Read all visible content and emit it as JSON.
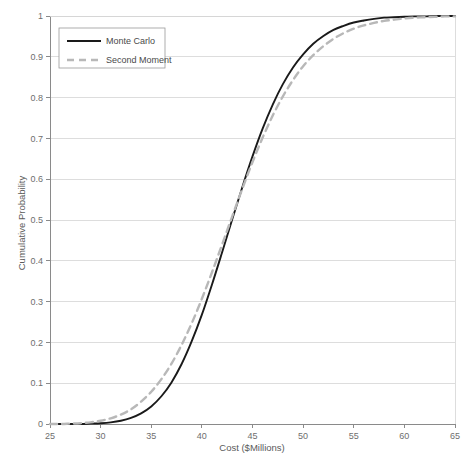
{
  "chart_data": {
    "type": "line",
    "title": "",
    "subtitle": "",
    "xlabel": "Cost ($Millions)",
    "ylabel": "Cumulative Probability",
    "xlim": [
      25,
      65
    ],
    "ylim": [
      0,
      1
    ],
    "xticks": [
      25,
      30,
      35,
      40,
      45,
      50,
      55,
      60,
      65
    ],
    "xtick_labels": [
      "25",
      "30",
      "35",
      "40",
      "45",
      "50",
      "55",
      "60",
      "65"
    ],
    "yticks": [
      0,
      0.1,
      0.2,
      0.3,
      0.4,
      0.5,
      0.6,
      0.7,
      0.8,
      0.9,
      1
    ],
    "ytick_labels": [
      "0",
      "0.1",
      "0.2",
      "0.3",
      "0.4",
      "0.5",
      "0.6",
      "0.7",
      "0.8",
      "0.9",
      "1"
    ],
    "grid": "horizontal",
    "legend_position": "top-left",
    "x": [
      25,
      26,
      27,
      28,
      29,
      30,
      31,
      32,
      33,
      34,
      35,
      36,
      37,
      38,
      39,
      40,
      41,
      42,
      43,
      44,
      45,
      46,
      47,
      48,
      49,
      50,
      51,
      52,
      53,
      54,
      55,
      56,
      57,
      58,
      59,
      60,
      61,
      62,
      63,
      64,
      65
    ],
    "series": [
      {
        "name": "Monte Carlo",
        "color": "#1a1a1a",
        "style": "solid",
        "width": 1.9,
        "values": [
          0.0,
          0.0,
          0.0,
          0.0,
          0.001,
          0.002,
          0.004,
          0.008,
          0.015,
          0.026,
          0.043,
          0.068,
          0.102,
          0.147,
          0.203,
          0.268,
          0.342,
          0.421,
          0.502,
          0.581,
          0.656,
          0.724,
          0.783,
          0.833,
          0.874,
          0.906,
          0.932,
          0.951,
          0.966,
          0.976,
          0.984,
          0.989,
          0.993,
          0.996,
          0.997,
          0.998,
          0.999,
          0.999,
          1.0,
          1.0,
          1.0
        ]
      },
      {
        "name": "Second Moment",
        "color": "#b8b8b8",
        "style": "dashed",
        "width": 2.4,
        "values": [
          0.0,
          0.0,
          0.001,
          0.002,
          0.004,
          0.008,
          0.014,
          0.023,
          0.036,
          0.055,
          0.079,
          0.11,
          0.148,
          0.194,
          0.247,
          0.307,
          0.372,
          0.44,
          0.509,
          0.577,
          0.642,
          0.702,
          0.756,
          0.803,
          0.843,
          0.877,
          0.904,
          0.926,
          0.944,
          0.958,
          0.969,
          0.977,
          0.983,
          0.988,
          0.991,
          0.994,
          0.996,
          0.997,
          0.998,
          0.999,
          0.999
        ]
      }
    ],
    "annotations": []
  },
  "legend": {
    "entries": [
      {
        "label": "Monte Carlo"
      },
      {
        "label": "Second Moment"
      }
    ]
  },
  "colors": {
    "monte_carlo": "#1a1a1a",
    "second_moment": "#b8b8b8",
    "gridline": "#d4d4d4",
    "axis": "#8a8a8a",
    "text": "#6e6e6e"
  }
}
